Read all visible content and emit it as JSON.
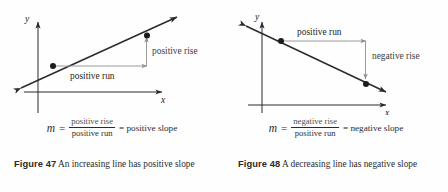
{
  "figures": [
    {
      "id": "figure-47",
      "axis": {
        "x_label": "x",
        "y_label": "y"
      },
      "annotations": {
        "run": "positive run",
        "rise": "positive rise"
      },
      "formula": {
        "variable": "m",
        "equals": "=",
        "numerator": "positive rise",
        "denominator": "positive run",
        "result": "= positive slope"
      },
      "caption": {
        "number": "Figure 47",
        "text": "An increasing line has positive slope"
      }
    },
    {
      "id": "figure-48",
      "axis": {
        "x_label": "x",
        "y_label": "y"
      },
      "annotations": {
        "run": "positive run",
        "rise": "negative rise"
      },
      "formula": {
        "variable": "m",
        "equals": "=",
        "numerator": "negative rise",
        "denominator": "positive run",
        "result": "= negative slope"
      },
      "caption": {
        "number": "Figure 48",
        "text": "A decreasing line has negative slope"
      }
    }
  ],
  "colors": {
    "ink": "#2b2b2b",
    "annotation_gray": "#9a9a9a",
    "label_gray": "#3d3d3d",
    "background": "#fefefe"
  }
}
